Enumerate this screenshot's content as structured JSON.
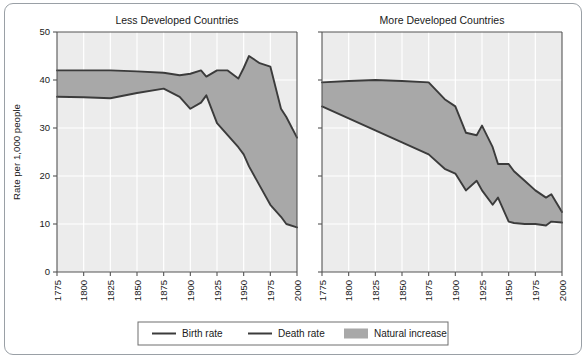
{
  "figure": {
    "y_axis_label": "Rate per 1,000 people",
    "legend": {
      "birth_label": "Birth rate",
      "death_label": "Death rate",
      "area_label": "Natural increase"
    },
    "colors": {
      "line": "#3b3b3b",
      "area_fill": "#a8a8a8",
      "plot_bg": "#ececec",
      "gridline": "#ffffff",
      "frame": "#9aa0a6",
      "axis": "#555555",
      "text": "#1a1a1a"
    }
  },
  "chart_data": [
    {
      "type": "area",
      "title": "Less Developed Countries",
      "xlabel": "",
      "ylabel": "Rate per 1,000 people",
      "xlim": [
        1775,
        2000
      ],
      "ylim": [
        0,
        50
      ],
      "xticks": [
        "1775",
        "1800",
        "1825",
        "1850",
        "1875",
        "1900",
        "1925",
        "1950",
        "1975",
        "2000"
      ],
      "yticks": [
        "0",
        "10",
        "20",
        "30",
        "40",
        "50"
      ],
      "grid": true,
      "legend_position": "bottom",
      "x": [
        1775,
        1800,
        1825,
        1850,
        1875,
        1890,
        1900,
        1910,
        1915,
        1925,
        1935,
        1945,
        1950,
        1955,
        1965,
        1975,
        1985,
        1990,
        2000
      ],
      "series": [
        {
          "name": "Birth rate",
          "values": [
            42.0,
            42.0,
            42.0,
            41.8,
            41.5,
            41.0,
            41.3,
            42.0,
            40.7,
            42.0,
            42.0,
            40.3,
            42.5,
            45.0,
            43.5,
            42.8,
            34.0,
            32.3,
            28.0
          ]
        },
        {
          "name": "Death rate",
          "values": [
            36.5,
            36.4,
            36.2,
            37.3,
            38.2,
            36.5,
            34.0,
            35.3,
            36.8,
            31.0,
            28.5,
            26.0,
            24.5,
            22.0,
            18.0,
            14.0,
            11.5,
            10.0,
            9.3
          ]
        }
      ],
      "shaded_between": [
        "Birth rate",
        "Death rate"
      ],
      "shaded_label": "Natural increase"
    },
    {
      "type": "area",
      "title": "More Developed Countries",
      "xlabel": "",
      "ylabel": "",
      "xlim": [
        1775,
        2000
      ],
      "ylim": [
        0,
        50
      ],
      "xticks": [
        "1775",
        "1800",
        "1825",
        "1850",
        "1875",
        "1900",
        "1925",
        "1950",
        "1975",
        "2000"
      ],
      "yticks": [
        "0",
        "10",
        "20",
        "30",
        "40",
        "50"
      ],
      "grid": true,
      "legend_position": "bottom",
      "x": [
        1775,
        1800,
        1825,
        1850,
        1875,
        1890,
        1900,
        1910,
        1920,
        1925,
        1935,
        1940,
        1950,
        1955,
        1965,
        1975,
        1985,
        1990,
        2000
      ],
      "series": [
        {
          "name": "Birth rate",
          "values": [
            39.5,
            39.8,
            40.0,
            39.8,
            39.5,
            36.0,
            34.5,
            29.0,
            28.5,
            30.5,
            26.0,
            22.5,
            22.5,
            21.0,
            19.0,
            17.0,
            15.5,
            16.2,
            12.5
          ]
        },
        {
          "name": "Death rate",
          "values": [
            34.5,
            32.0,
            29.5,
            27.0,
            24.5,
            21.5,
            20.5,
            17.0,
            19.0,
            17.0,
            14.0,
            15.5,
            10.5,
            10.2,
            10.0,
            10.0,
            9.7,
            10.5,
            10.3
          ]
        }
      ],
      "shaded_between": [
        "Birth rate",
        "Death rate"
      ],
      "shaded_label": "Natural increase"
    }
  ]
}
